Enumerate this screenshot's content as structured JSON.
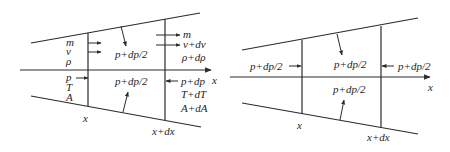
{
  "diagrams": [
    {
      "id": "left",
      "axis_label": "x",
      "section_labels": {
        "left": "x",
        "right": "x+dx"
      },
      "inlet_quantities": [
        "m",
        "v",
        "ρ",
        "p",
        "T",
        "A"
      ],
      "outlet_quantities": [
        "m",
        "v+dv",
        "ρ+dρ",
        "p+dp",
        "T+dT",
        "A+dA"
      ],
      "wall_pressure_top": "p+dp/2",
      "wall_pressure_bottom": "p+dp/2"
    },
    {
      "id": "right",
      "axis_label": "x",
      "section_labels": {
        "left": "x",
        "right": "x+dx"
      },
      "inlet_pressure": "p+dp/2",
      "outlet_pressure": "p+dp/2",
      "wall_pressure_top": "p+dp/2",
      "wall_pressure_bottom": "p+dp/2"
    }
  ]
}
